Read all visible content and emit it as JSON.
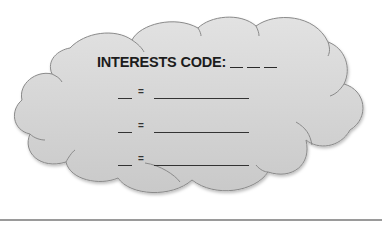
{
  "diagram": {
    "shape": "cloud",
    "fill_color": "#d4d4d4",
    "stroke_color": "#8a8a8a",
    "title": "INTERESTS CODE:",
    "code_blanks": 3,
    "rows": [
      {
        "equals": "="
      },
      {
        "equals": "="
      },
      {
        "equals": "="
      }
    ]
  }
}
